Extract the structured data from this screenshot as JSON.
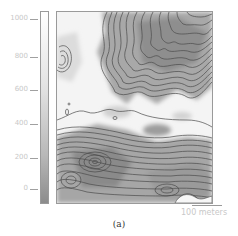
{
  "figure": {
    "caption": "(a)",
    "colorbar": {
      "ticks": [
        {
          "label": "1000",
          "y": 19
        },
        {
          "label": "800",
          "y": 57
        },
        {
          "label": "600",
          "y": 90
        },
        {
          "label": "400",
          "y": 124
        },
        {
          "label": "200",
          "y": 158
        },
        {
          "label": "0",
          "y": 189
        }
      ],
      "min": 0,
      "max": 1000
    },
    "scale_bar": {
      "label": "100 meters"
    },
    "plot": {
      "type": "contour map",
      "colors": {
        "high": "#ffffff",
        "low": "#8c8c8c",
        "contour_line": "#4a4a4a"
      }
    }
  }
}
